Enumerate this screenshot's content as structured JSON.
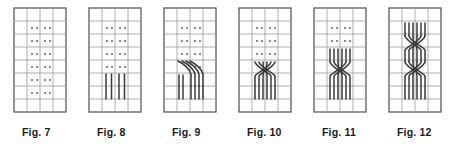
{
  "figure_strip": {
    "title": "Knitting cable chart sequence Fig. 7 to Fig. 12",
    "panel_count": 6,
    "colors": {
      "border": "#4d4d4d",
      "gridline": "#9a9a9a",
      "dot": "#8c8c8c",
      "stroke": "#3a3a3a",
      "background": "#ffffff",
      "caption": "#1a1a1a"
    },
    "grid": {
      "columns": 4,
      "rows": 8,
      "cell_width": 13,
      "cell_height": 13,
      "origin_x": 8,
      "origin_y": 8
    },
    "panels": [
      {
        "caption": "Fig. 7",
        "left": 8,
        "dot_rows": [
          1,
          2,
          3,
          4,
          5,
          6
        ],
        "dot_columns": [
          1,
          2
        ],
        "strokes": "none",
        "description": "empty grid with purl dot symbols"
      },
      {
        "caption": "Fig. 8",
        "left": 83,
        "dot_rows": [
          1,
          2,
          3,
          4
        ],
        "dot_columns": [
          1,
          2
        ],
        "strokes": "verticals",
        "vertical_count": 4,
        "vertical_top_row": 5,
        "vertical_bottom_row": 7,
        "description": "four straight vertical strands below the dots"
      },
      {
        "caption": "Fig. 9",
        "left": 158,
        "dot_rows": [
          1,
          2,
          3
        ],
        "dot_columns": [
          1,
          2
        ],
        "strokes": "diagonals-into-verticals",
        "vertical_count": 4,
        "description": "strands sweep diagonally then run straight down"
      },
      {
        "caption": "Fig. 10",
        "left": 233,
        "dot_rows": [
          1,
          2,
          3
        ],
        "dot_columns": [
          1,
          2
        ],
        "strokes": "single-cross",
        "crossing_count": 1,
        "description": "four strands with one X crossing"
      },
      {
        "caption": "Fig. 11",
        "left": 308,
        "dot_rows": [
          1,
          2
        ],
        "dot_columns": [
          1,
          2
        ],
        "strokes": "cross-with-verticals",
        "crossing_count": 1,
        "description": "vertical strands above a single X crossing"
      },
      {
        "caption": "Fig. 12",
        "left": 383,
        "dot_rows": [],
        "dot_columns": [],
        "strokes": "double-cross",
        "crossing_count": 2,
        "description": "braid with two stacked X crossings"
      }
    ]
  }
}
